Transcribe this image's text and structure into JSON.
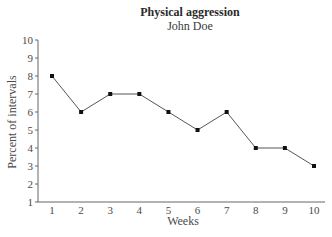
{
  "chart_data": {
    "type": "line",
    "title": "Physical aggression",
    "subtitle": "John Doe",
    "xlabel": "Weeks",
    "ylabel": "Percent of intervals",
    "categories": [
      "1",
      "2",
      "3",
      "4",
      "5",
      "6",
      "7",
      "8",
      "9",
      "10"
    ],
    "x": [
      1,
      2,
      3,
      4,
      5,
      6,
      7,
      8,
      9,
      10
    ],
    "series": [
      {
        "name": "Physical aggression",
        "values": [
          8,
          6,
          7,
          7,
          6,
          5,
          6,
          4,
          4,
          3
        ]
      }
    ],
    "ylim": [
      1,
      10
    ],
    "yticks": [
      1,
      2,
      3,
      4,
      5,
      6,
      7,
      8,
      9,
      10
    ],
    "grid": false,
    "legend": "none",
    "marker": "square",
    "colors": {
      "line": "#555555",
      "marker": "#111111",
      "axis": "#666666",
      "text": "#444444"
    }
  }
}
